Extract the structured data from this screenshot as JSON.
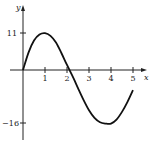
{
  "chart_data": {
    "type": "line",
    "title": "",
    "xlabel": "x",
    "ylabel": "y",
    "x_ticks": [
      "1",
      "2",
      "3",
      "4",
      "5"
    ],
    "y_ticks": [
      "11",
      "−16"
    ],
    "xlim": [
      0,
      5.3
    ],
    "ylim": [
      -18,
      14
    ],
    "grid": false,
    "legend": null,
    "series": [
      {
        "name": "f(x)",
        "x": [
          0,
          0.25,
          0.5,
          0.75,
          1,
          1.25,
          1.5,
          1.75,
          2,
          2.3,
          2.5,
          2.75,
          3,
          3.25,
          3.5,
          3.75,
          4,
          4.25,
          4.5,
          4.75,
          5
        ],
        "values": [
          0,
          5.2,
          8.8,
          10.6,
          11,
          10.2,
          8.2,
          5.0,
          1.5,
          -2.5,
          -5.4,
          -8.9,
          -12,
          -14.3,
          -15.6,
          -16,
          -16,
          -14.8,
          -12.5,
          -9.5,
          -6
        ]
      }
    ]
  }
}
